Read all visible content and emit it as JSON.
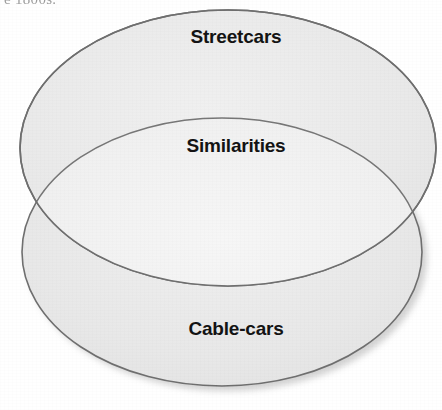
{
  "page": {
    "width": 442,
    "height": 410,
    "background_color": "#ffffff",
    "cropped_text_above": "e 1800s."
  },
  "diagram": {
    "type": "venn",
    "sets": 2,
    "outline_color": "#6b6b6b",
    "fill_color": "#e8e8e8",
    "overlap_fill_color": "#f1f1f1",
    "shadow_color": "#c9c9c9",
    "label_color": "#141414",
    "top_ellipse": {
      "label": "Streetcars",
      "cx": 228,
      "cy": 148,
      "rx": 208,
      "ry": 138
    },
    "bottom_ellipse": {
      "label": "Cable-cars",
      "cx": 222,
      "cy": 252,
      "rx": 200,
      "ry": 134
    },
    "overlap": {
      "label": "Similarities"
    },
    "labels": [
      "Streetcars",
      "Similarities",
      "Cable-cars"
    ]
  }
}
